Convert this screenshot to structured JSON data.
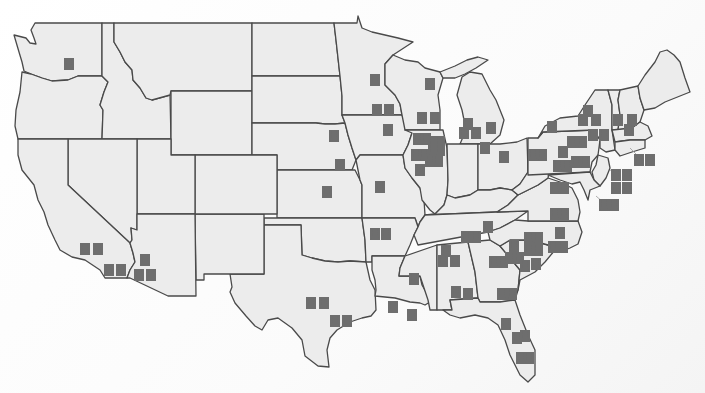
{
  "map": {
    "title": "",
    "subject": "United States nuclear power plant locations",
    "colors": {
      "background": "#ffffff",
      "land_fill": "#ececec",
      "border": "#4a4a4a",
      "plant_icon": "#6e6e6e"
    },
    "icon": "cooling-tower-icon",
    "plants": [
      {
        "state": "WA",
        "x": 69,
        "y": 64
      },
      {
        "state": "CA",
        "x": 85,
        "y": 249
      },
      {
        "state": "CA",
        "x": 98,
        "y": 249
      },
      {
        "state": "CA",
        "x": 109,
        "y": 270
      },
      {
        "state": "CA",
        "x": 121,
        "y": 270
      },
      {
        "state": "AZ",
        "x": 145,
        "y": 260
      },
      {
        "state": "AZ",
        "x": 139,
        "y": 275
      },
      {
        "state": "AZ",
        "x": 151,
        "y": 275
      },
      {
        "state": "MN",
        "x": 375,
        "y": 80
      },
      {
        "state": "MN",
        "x": 377,
        "y": 110
      },
      {
        "state": "MN",
        "x": 389,
        "y": 110
      },
      {
        "state": "IA",
        "x": 388,
        "y": 130
      },
      {
        "state": "NE",
        "x": 334,
        "y": 136
      },
      {
        "state": "NE",
        "x": 340,
        "y": 165
      },
      {
        "state": "KS",
        "x": 327,
        "y": 192
      },
      {
        "state": "MO",
        "x": 380,
        "y": 187
      },
      {
        "state": "WI",
        "x": 430,
        "y": 84
      },
      {
        "state": "WI",
        "x": 422,
        "y": 118
      },
      {
        "state": "WI",
        "x": 435,
        "y": 118
      },
      {
        "state": "IL",
        "x": 418,
        "y": 139
      },
      {
        "state": "IL",
        "x": 426,
        "y": 139
      },
      {
        "state": "IL",
        "x": 433,
        "y": 142
      },
      {
        "state": "IL",
        "x": 440,
        "y": 142
      },
      {
        "state": "IL",
        "x": 416,
        "y": 155
      },
      {
        "state": "IL",
        "x": 424,
        "y": 155
      },
      {
        "state": "IL",
        "x": 433,
        "y": 150
      },
      {
        "state": "IL",
        "x": 440,
        "y": 150
      },
      {
        "state": "IL",
        "x": 430,
        "y": 161
      },
      {
        "state": "IL",
        "x": 438,
        "y": 161
      },
      {
        "state": "IL",
        "x": 420,
        "y": 170
      },
      {
        "state": "MI",
        "x": 468,
        "y": 124
      },
      {
        "state": "MI",
        "x": 464,
        "y": 133
      },
      {
        "state": "MI",
        "x": 476,
        "y": 133
      },
      {
        "state": "MI",
        "x": 491,
        "y": 128
      },
      {
        "state": "IN",
        "x": 485,
        "y": 148
      },
      {
        "state": "OH",
        "x": 504,
        "y": 157
      },
      {
        "state": "NY",
        "x": 552,
        "y": 127
      },
      {
        "state": "NY",
        "x": 588,
        "y": 111
      },
      {
        "state": "NY",
        "x": 583,
        "y": 120
      },
      {
        "state": "NY",
        "x": 596,
        "y": 120
      },
      {
        "state": "NY",
        "x": 593,
        "y": 135
      },
      {
        "state": "NY",
        "x": 604,
        "y": 135
      },
      {
        "state": "VT",
        "x": 618,
        "y": 120
      },
      {
        "state": "NH",
        "x": 632,
        "y": 120
      },
      {
        "state": "NH",
        "x": 629,
        "y": 130
      },
      {
        "state": "PA",
        "x": 533,
        "y": 155
      },
      {
        "state": "PA",
        "x": 542,
        "y": 155
      },
      {
        "state": "PA",
        "x": 572,
        "y": 142
      },
      {
        "state": "PA",
        "x": 582,
        "y": 142
      },
      {
        "state": "PA",
        "x": 563,
        "y": 152
      },
      {
        "state": "PA",
        "x": 558,
        "y": 166
      },
      {
        "state": "PA",
        "x": 567,
        "y": 166
      },
      {
        "state": "PA",
        "x": 576,
        "y": 162
      },
      {
        "state": "PA",
        "x": 585,
        "y": 162
      },
      {
        "state": "CT",
        "x": 639,
        "y": 160
      },
      {
        "state": "CT",
        "x": 650,
        "y": 160
      },
      {
        "state": "NJ",
        "x": 616,
        "y": 175
      },
      {
        "state": "NJ",
        "x": 627,
        "y": 175
      },
      {
        "state": "NJ",
        "x": 616,
        "y": 188
      },
      {
        "state": "NJ",
        "x": 627,
        "y": 188
      },
      {
        "state": "MD",
        "x": 604,
        "y": 205
      },
      {
        "state": "MD",
        "x": 614,
        "y": 205
      },
      {
        "state": "VA",
        "x": 555,
        "y": 188
      },
      {
        "state": "VA",
        "x": 564,
        "y": 188
      },
      {
        "state": "VA",
        "x": 555,
        "y": 214
      },
      {
        "state": "VA",
        "x": 564,
        "y": 214
      },
      {
        "state": "TN",
        "x": 488,
        "y": 227
      },
      {
        "state": "TN",
        "x": 466,
        "y": 237
      },
      {
        "state": "TN",
        "x": 476,
        "y": 237
      },
      {
        "state": "NC",
        "x": 560,
        "y": 233
      },
      {
        "state": "NC",
        "x": 553,
        "y": 247
      },
      {
        "state": "NC",
        "x": 563,
        "y": 247
      },
      {
        "state": "SC",
        "x": 529,
        "y": 238
      },
      {
        "state": "SC",
        "x": 538,
        "y": 238
      },
      {
        "state": "SC",
        "x": 514,
        "y": 246
      },
      {
        "state": "SC",
        "x": 529,
        "y": 250
      },
      {
        "state": "SC",
        "x": 538,
        "y": 250
      },
      {
        "state": "SC",
        "x": 510,
        "y": 258
      },
      {
        "state": "SC",
        "x": 519,
        "y": 258
      },
      {
        "state": "SC",
        "x": 525,
        "y": 266
      },
      {
        "state": "SC",
        "x": 536,
        "y": 264
      },
      {
        "state": "GA",
        "x": 494,
        "y": 262
      },
      {
        "state": "GA",
        "x": 503,
        "y": 262
      },
      {
        "state": "GA",
        "x": 502,
        "y": 294
      },
      {
        "state": "GA",
        "x": 512,
        "y": 294
      },
      {
        "state": "AL",
        "x": 446,
        "y": 251
      },
      {
        "state": "AL",
        "x": 443,
        "y": 261
      },
      {
        "state": "AL",
        "x": 455,
        "y": 261
      },
      {
        "state": "AL",
        "x": 456,
        "y": 292
      },
      {
        "state": "AL",
        "x": 468,
        "y": 294
      },
      {
        "state": "MS",
        "x": 414,
        "y": 279
      },
      {
        "state": "LA",
        "x": 393,
        "y": 307
      },
      {
        "state": "LA",
        "x": 412,
        "y": 315
      },
      {
        "state": "AR",
        "x": 375,
        "y": 234
      },
      {
        "state": "AR",
        "x": 386,
        "y": 234
      },
      {
        "state": "TX",
        "x": 311,
        "y": 303
      },
      {
        "state": "TX",
        "x": 324,
        "y": 303
      },
      {
        "state": "TX",
        "x": 335,
        "y": 321
      },
      {
        "state": "TX",
        "x": 347,
        "y": 321
      },
      {
        "state": "FL",
        "x": 506,
        "y": 324
      },
      {
        "state": "FL",
        "x": 517,
        "y": 338
      },
      {
        "state": "FL",
        "x": 525,
        "y": 336
      },
      {
        "state": "FL",
        "x": 521,
        "y": 358
      },
      {
        "state": "FL",
        "x": 529,
        "y": 358
      }
    ]
  }
}
